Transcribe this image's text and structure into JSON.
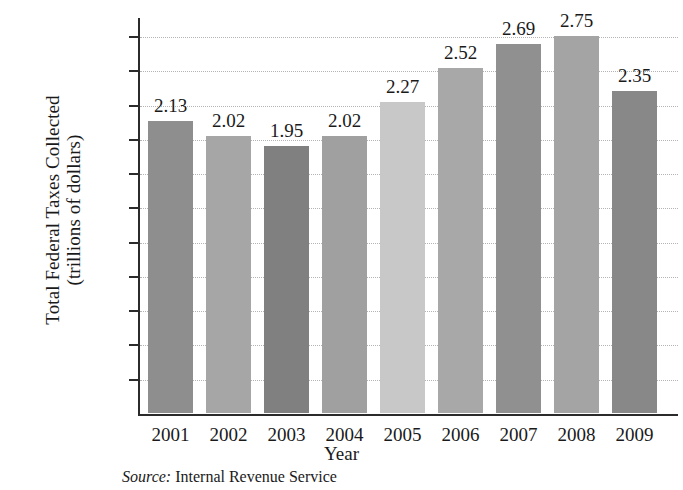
{
  "chart_data": {
    "type": "bar",
    "title": "",
    "xlabel": "Year",
    "ylabel_lines": [
      "Total Federal Taxes Collected",
      "(trillions of dollars)"
    ],
    "ylabel": "Total Federal Taxes Collected (trillions of dollars)",
    "categories": [
      "2001",
      "2002",
      "2003",
      "2004",
      "2005",
      "2006",
      "2007",
      "2008",
      "2009"
    ],
    "values": [
      2.13,
      2.02,
      1.95,
      2.02,
      2.27,
      2.52,
      2.69,
      2.75,
      2.35
    ],
    "value_labels": [
      "2.13",
      "2.02",
      "1.95",
      "2.02",
      "2.27",
      "2.52",
      "2.69",
      "2.75",
      "2.35"
    ],
    "bar_colors": [
      "#8e8e8e",
      "#a6a6a6",
      "#808080",
      "#a0a0a0",
      "#c8c8c8",
      "#a8a8a8",
      "#909090",
      "#a4a4a4",
      "#888888"
    ],
    "ylim": [
      0,
      2.75
    ],
    "ytick_values": [
      0.25,
      0.5,
      0.75,
      1.0,
      1.25,
      1.5,
      1.75,
      2.0,
      2.25,
      2.5,
      2.75
    ],
    "ytick_labels": [
      "$0.25",
      "$0.50",
      "$0.75",
      "$1.00",
      "$1.25",
      "$1.50",
      "$1.75",
      "$2.00",
      "$2.25",
      "$2.50",
      "$2.75"
    ],
    "grid": true,
    "grid_axis": "y",
    "legend": "none"
  },
  "source": {
    "prefix": "Source:",
    "text": "Internal Revenue Service"
  }
}
